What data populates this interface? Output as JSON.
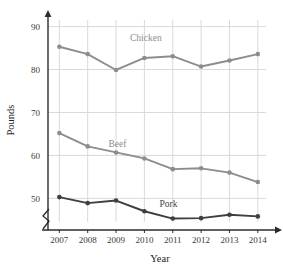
{
  "chart_data": {
    "type": "line",
    "title": "",
    "xlabel": "Year",
    "ylabel": "Pounds",
    "categories": [
      "2007",
      "2008",
      "2009",
      "2010",
      "2011",
      "2012",
      "2013",
      "2014"
    ],
    "x": [
      2007,
      2008,
      2009,
      2010,
      2011,
      2012,
      2013,
      2014
    ],
    "xlim": [
      2006.6,
      2014.5
    ],
    "ylim": [
      44.5,
      92
    ],
    "yticks": [
      50,
      60,
      70,
      80,
      90
    ],
    "ytick_labels": [
      "50",
      "60",
      "70",
      "80",
      "90"
    ],
    "y_axis_break": true,
    "grid": true,
    "legend": "inline-labels",
    "series": [
      {
        "name": "Chicken",
        "color": "#8d8d8d",
        "values": [
          85.3,
          83.6,
          79.9,
          82.7,
          83.1,
          80.7,
          82.1,
          83.6
        ]
      },
      {
        "name": "Beef",
        "color": "#8d8d8d",
        "values": [
          65.2,
          62.1,
          60.7,
          59.3,
          56.8,
          57.0,
          56.0,
          53.8
        ]
      },
      {
        "name": "Pork",
        "color": "#3f3f3f",
        "values": [
          50.3,
          48.9,
          49.5,
          47.0,
          45.3,
          45.4,
          46.2,
          45.8
        ]
      }
    ],
    "annotations": [
      {
        "text": "Chicken",
        "x": 2010.05,
        "y": 86.6,
        "color": "#8d8d8d"
      },
      {
        "text": "Beef",
        "x": 2009.05,
        "y": 62.0,
        "color": "#8d8d8d"
      },
      {
        "text": "Pork",
        "x": 2010.85,
        "y": 47.9,
        "color": "#3f3f3f"
      }
    ],
    "colors": {
      "grid": "#d9d9d9",
      "axis": "#2b2b2b",
      "background": "#ffffff",
      "chicken": "#8d8d8d",
      "beef": "#8d8d8d",
      "pork": "#3f3f3f"
    }
  }
}
